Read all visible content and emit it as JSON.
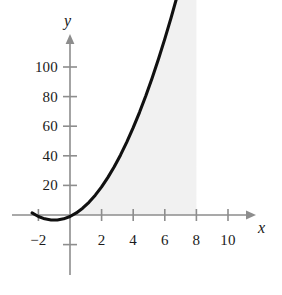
{
  "chart_data": {
    "type": "line",
    "title": "",
    "xlabel": "x",
    "ylabel": "y",
    "xlim": [
      -3.2,
      11.2
    ],
    "ylim": [
      -22,
      120
    ],
    "grid": false,
    "legend": null,
    "x_ticks": [
      {
        "value": -2,
        "label": "−2"
      },
      {
        "value": 2,
        "label": "2"
      },
      {
        "value": 4,
        "label": "4"
      },
      {
        "value": 6,
        "label": "6"
      },
      {
        "value": 8,
        "label": "8"
      },
      {
        "value": 10,
        "label": "10"
      }
    ],
    "y_ticks": [
      {
        "value": 20,
        "label": "20"
      },
      {
        "value": 40,
        "label": "40"
      },
      {
        "value": 60,
        "label": "60"
      },
      {
        "value": 80,
        "label": "80"
      },
      {
        "value": 100,
        "label": "100"
      }
    ],
    "series": [
      {
        "name": "curve",
        "color": "#111111",
        "x": [
          -2.4,
          -2.0,
          -1.6,
          -1.2,
          -0.8,
          -0.4,
          0.0,
          0.4,
          0.8,
          1.2,
          1.6,
          2.0,
          2.4,
          2.8,
          3.2,
          3.6,
          4.0,
          4.4,
          4.8,
          5.2,
          5.6,
          6.0,
          6.4,
          6.8,
          7.2,
          7.6,
          8.0,
          8.4,
          8.8
        ],
        "y": [
          1.4,
          -1.0,
          -2.6,
          -3.4,
          -3.4,
          -2.6,
          -1.0,
          1.4,
          4.6,
          8.6,
          13.4,
          19.0,
          25.4,
          32.6,
          40.6,
          49.4,
          59.0,
          69.4,
          80.6,
          92.6,
          105.4,
          119.0,
          133.4,
          148.6,
          164.6,
          181.4,
          199.0,
          217.4,
          236.6
        ]
      }
    ],
    "shaded_region": {
      "fill": "#f1f1f1",
      "x_from": 0,
      "x_to": 8,
      "baseline": 0
    },
    "axis_color": "#8d8d8d",
    "text_color": "#1b1b1b"
  }
}
